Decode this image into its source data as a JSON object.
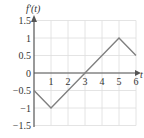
{
  "chart_data": {
    "type": "line",
    "title": "",
    "xlabel": "t",
    "ylabel": "f'(t)",
    "xlim": [
      0,
      6
    ],
    "ylim": [
      -1.5,
      1.5
    ],
    "grid": true,
    "x_ticks": [
      "1",
      "2",
      "3",
      "4",
      "5",
      "6"
    ],
    "y_ticks": [
      "1.5",
      "1",
      "0.5",
      "0",
      "-0.5",
      "-1",
      "-1.5"
    ],
    "series": [
      {
        "name": "f'(t)",
        "x": [
          0,
          1,
          5,
          6
        ],
        "y": [
          -0.5,
          -1,
          1,
          0.5
        ]
      }
    ],
    "colors": {
      "line": "#808080",
      "axis": "#555555",
      "grid": "#dddddd"
    }
  }
}
